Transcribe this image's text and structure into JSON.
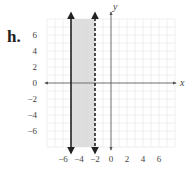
{
  "problem": {
    "label": "h."
  },
  "colors": {
    "grid": "#e4e4e4",
    "shade": "#d6d6d6",
    "axis": "#555555",
    "boundary": "#222222",
    "text": "#444444"
  },
  "chart_data": {
    "type": "inequality-graph",
    "title": "",
    "xlabel": "x",
    "ylabel": "y",
    "xlim": [
      -8,
      8
    ],
    "ylim": [
      -8,
      8
    ],
    "grid": true,
    "x_ticks": [
      -6,
      -4,
      -2,
      0,
      2,
      4,
      6
    ],
    "x_tick_labels": [
      "−6",
      "−4",
      "−2",
      "0",
      "2",
      "4",
      "6"
    ],
    "y_ticks": [
      6,
      4,
      2,
      0,
      -2,
      -4,
      -6
    ],
    "y_tick_labels": [
      "6",
      "4",
      "2",
      "0",
      "−2",
      "−4",
      "−6"
    ],
    "boundaries": [
      {
        "equation": "x = -5",
        "x": -5,
        "style": "solid"
      },
      {
        "equation": "x = -2",
        "x": -2,
        "style": "dashed"
      }
    ],
    "shaded_region": {
      "x_from": -5,
      "x_to": -2,
      "description": "-5 ≤ x < -2"
    }
  }
}
